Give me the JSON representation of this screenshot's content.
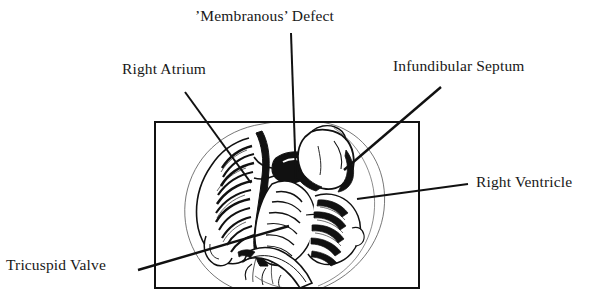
{
  "figure": {
    "type": "anatomical-line-drawing",
    "frame": {
      "shape": "rectangle",
      "x": 155,
      "y": 122,
      "width": 264,
      "height": 166,
      "stroke_color": "#111111",
      "stroke_width": 2,
      "fill": "#ffffff"
    },
    "ink_color": "#111111",
    "background_color": "#ffffff"
  },
  "labels": [
    {
      "id": "membranous-defect",
      "text": "’Membranous’ Defect",
      "position": "top-center",
      "leader": {
        "x1": 291,
        "y1": 33,
        "x2": 296,
        "y2": 179
      }
    },
    {
      "id": "right-atrium",
      "text": "Right Atrium",
      "position": "top-left",
      "leader": {
        "x1": 185,
        "y1": 92,
        "x2": 251,
        "y2": 183
      }
    },
    {
      "id": "infundibular-septum",
      "text": "Infundibular Septum",
      "position": "top-right",
      "leader": {
        "x1": 441,
        "y1": 87,
        "x2": 344,
        "y2": 170
      }
    },
    {
      "id": "right-ventricle",
      "text": "Right Ventricle",
      "position": "middle-right",
      "leader": {
        "x1": 468,
        "y1": 184,
        "x2": 357,
        "y2": 199
      }
    },
    {
      "id": "tricuspid-valve",
      "text": "Tricuspid Valve",
      "position": "bottom-left",
      "leader": {
        "x1": 138,
        "y1": 270,
        "x2": 289,
        "y2": 226
      }
    }
  ]
}
